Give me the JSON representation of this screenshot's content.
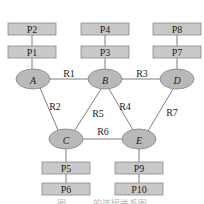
{
  "diagram": {
    "nodes": [
      {
        "id": "A",
        "label": "A",
        "cx": 33,
        "cy": 79
      },
      {
        "id": "B",
        "label": "B",
        "cx": 105,
        "cy": 79
      },
      {
        "id": "D",
        "label": "D",
        "cx": 177,
        "cy": 79
      },
      {
        "id": "C",
        "label": "C",
        "cx": 66,
        "cy": 139
      },
      {
        "id": "E",
        "label": "E",
        "cx": 139,
        "cy": 139
      }
    ],
    "edges": [
      {
        "label": "R1",
        "from": "A",
        "to": "B",
        "lx": 69,
        "ly": 73
      },
      {
        "label": "R3",
        "from": "B",
        "to": "D",
        "lx": 142,
        "ly": 73
      },
      {
        "label": "R2",
        "from": "A",
        "to": "C",
        "lx": 55,
        "ly": 106
      },
      {
        "label": "R5",
        "from": "B",
        "to": "C",
        "lx": 98,
        "ly": 113
      },
      {
        "label": "R4",
        "from": "B",
        "to": "E",
        "lx": 125,
        "ly": 106
      },
      {
        "label": "R7",
        "from": "D",
        "to": "E",
        "lx": 172,
        "ly": 112
      },
      {
        "label": "R6",
        "from": "C",
        "to": "E",
        "lx": 103,
        "ly": 131
      }
    ],
    "peripherals": [
      {
        "label": "P2",
        "x": 8,
        "y": 23,
        "attached_to": "P1"
      },
      {
        "label": "P1",
        "x": 8,
        "y": 46,
        "attached_to": "A"
      },
      {
        "label": "P4",
        "x": 81,
        "y": 23,
        "attached_to": "P3"
      },
      {
        "label": "P3",
        "x": 81,
        "y": 46,
        "attached_to": "B"
      },
      {
        "label": "P8",
        "x": 153,
        "y": 23,
        "attached_to": "P7"
      },
      {
        "label": "P7",
        "x": 153,
        "y": 46,
        "attached_to": "D"
      },
      {
        "label": "P5",
        "x": 42,
        "y": 162,
        "attached_to": "C"
      },
      {
        "label": "P6",
        "x": 42,
        "y": 183,
        "attached_to": "P5"
      },
      {
        "label": "P9",
        "x": 115,
        "y": 162,
        "attached_to": "E"
      },
      {
        "label": "P10",
        "x": 115,
        "y": 183,
        "attached_to": "P9"
      }
    ],
    "caption": "图 … … 的连接关系图"
  }
}
